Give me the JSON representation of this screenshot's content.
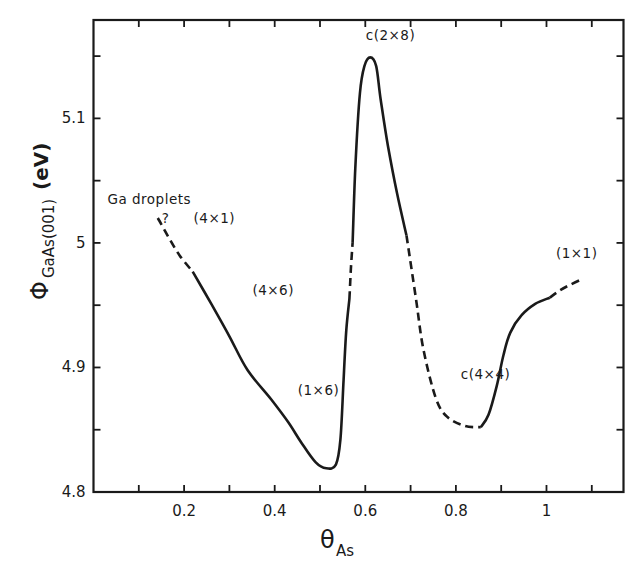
{
  "chart_data": {
    "type": "line",
    "title": "",
    "xlabel": "θ_As",
    "ylabel": "Φ_GaAs(001) (eV)",
    "xlim": [
      0,
      1.17
    ],
    "ylim": [
      4.8,
      5.179
    ],
    "grid": false,
    "legend": null,
    "x_ticks": [
      0.2,
      0.4,
      0.6,
      0.8,
      1
    ],
    "x_tick_labels": [
      "0.2",
      "0.4",
      "0.6",
      "0.8",
      "1"
    ],
    "x_minor_ticks": [
      0.1,
      0.3,
      0.5,
      0.7,
      0.9,
      1.1
    ],
    "y_ticks": [
      4.8,
      4.9,
      5,
      5.1
    ],
    "y_tick_labels": [
      "4.8",
      "4.9",
      "5",
      "5.1"
    ],
    "y_minor_ticks": [
      4.85,
      4.95,
      5.05,
      5.15
    ],
    "series": [
      {
        "name": "work function",
        "segments": [
          {
            "style": "dashed",
            "x": [
              0.142,
              0.165,
              0.19,
              0.219
            ],
            "y": [
              5.02,
              5.005,
              4.99,
              4.977
            ]
          },
          {
            "style": "solid",
            "x": [
              0.219,
              0.26,
              0.3,
              0.34,
              0.393,
              0.43,
              0.46,
              0.49,
              0.514,
              0.535,
              0.545,
              0.552,
              0.558,
              0.565
            ],
            "y": [
              4.977,
              4.951,
              4.925,
              4.898,
              4.874,
              4.856,
              4.839,
              4.824,
              4.819,
              4.822,
              4.842,
              4.89,
              4.93,
              4.955
            ]
          },
          {
            "style": "dashed",
            "x": [
              0.565,
              0.568,
              0.572
            ],
            "y": [
              4.955,
              4.978,
              5.0
            ]
          },
          {
            "style": "solid",
            "x": [
              0.572,
              0.578,
              0.588,
              0.598,
              0.611,
              0.624,
              0.634,
              0.65,
              0.67,
              0.691
            ],
            "y": [
              5.0,
              5.06,
              5.12,
              5.142,
              5.149,
              5.142,
              5.115,
              5.078,
              5.04,
              5.006
            ]
          },
          {
            "style": "dashed",
            "x": [
              0.691,
              0.712,
              0.728,
              0.756,
              0.782,
              0.82,
              0.855
            ],
            "y": [
              5.006,
              4.955,
              4.915,
              4.875,
              4.86,
              4.853,
              4.852
            ]
          },
          {
            "style": "solid",
            "x": [
              0.855,
              0.872,
              0.89,
              0.905,
              0.92,
              0.945,
              0.975,
              1.007
            ],
            "y": [
              4.852,
              4.862,
              4.885,
              4.91,
              4.928,
              4.942,
              4.951,
              4.956
            ]
          },
          {
            "style": "dashed",
            "x": [
              1.007,
              1.03,
              1.05,
              1.073
            ],
            "y": [
              4.956,
              4.962,
              4.966,
              4.97
            ]
          }
        ]
      }
    ],
    "annotations": [
      {
        "text": "Ga droplets",
        "x": 0.0,
        "y": 5.031
      },
      {
        "text": "?",
        "x": 0.12,
        "y": 5.016
      },
      {
        "text": "(4×1)",
        "x": 0.19,
        "y": 5.016
      },
      {
        "text": "(4×6)",
        "x": 0.32,
        "y": 4.958
      },
      {
        "text": "(1×6)",
        "x": 0.42,
        "y": 4.878
      },
      {
        "text": "c(2×8)",
        "x": 0.57,
        "y": 5.163
      },
      {
        "text": "c(4×4)",
        "x": 0.78,
        "y": 4.891
      },
      {
        "text": "(1×1)",
        "x": 0.99,
        "y": 4.988
      }
    ]
  },
  "labels": {
    "ylabel_symbol": "Φ",
    "ylabel_sub": "GaAs(001)",
    "ylabel_unit": "(eV)",
    "xlabel_symbol": "θ",
    "xlabel_sub": "As"
  },
  "colors": {
    "ink": "#1a1a1a",
    "background": "#ffffff"
  }
}
